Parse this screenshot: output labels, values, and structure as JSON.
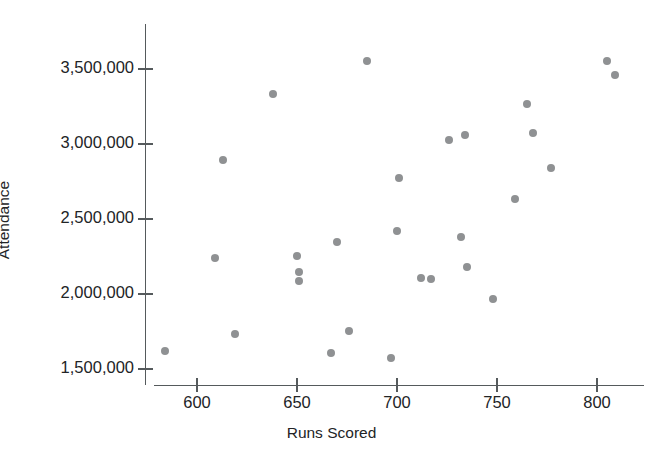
{
  "chart_data": {
    "type": "scatter",
    "title": "",
    "xlabel": "Runs Scored",
    "ylabel": "Attendance",
    "xlim": [
      575,
      820
    ],
    "ylim": [
      1425000,
      3650000
    ],
    "grid": false,
    "legend": null,
    "marker_color": "#87898b",
    "axis_color": "#555a5c",
    "x_ticks": [
      600,
      650,
      700,
      750,
      800
    ],
    "x_tick_labels": [
      "600",
      "650",
      "700",
      "750",
      "800"
    ],
    "y_ticks": [
      1500000,
      2000000,
      2500000,
      3000000,
      3500000
    ],
    "y_tick_labels": [
      "1,500,000",
      "2,000,000",
      "2,500,000",
      "3,000,000",
      "3,500,000"
    ],
    "points": [
      {
        "x": 584,
        "y": 1620000
      },
      {
        "x": 609,
        "y": 2240000
      },
      {
        "x": 613,
        "y": 2893000
      },
      {
        "x": 619,
        "y": 1733000
      },
      {
        "x": 638,
        "y": 3333000
      },
      {
        "x": 650,
        "y": 2253000
      },
      {
        "x": 651,
        "y": 2147000
      },
      {
        "x": 651,
        "y": 2087000
      },
      {
        "x": 667,
        "y": 1607000
      },
      {
        "x": 670,
        "y": 2347000
      },
      {
        "x": 676,
        "y": 1753000
      },
      {
        "x": 685,
        "y": 3553000
      },
      {
        "x": 697,
        "y": 1573000
      },
      {
        "x": 700,
        "y": 2420000
      },
      {
        "x": 701,
        "y": 2773000
      },
      {
        "x": 712,
        "y": 2107000
      },
      {
        "x": 717,
        "y": 2100000
      },
      {
        "x": 726,
        "y": 3027000
      },
      {
        "x": 732,
        "y": 2380000
      },
      {
        "x": 734,
        "y": 3060000
      },
      {
        "x": 735,
        "y": 2180000
      },
      {
        "x": 748,
        "y": 1967000
      },
      {
        "x": 759,
        "y": 2633000
      },
      {
        "x": 765,
        "y": 3267000
      },
      {
        "x": 768,
        "y": 3073000
      },
      {
        "x": 777,
        "y": 2840000
      },
      {
        "x": 805,
        "y": 3553000
      },
      {
        "x": 809,
        "y": 3460000
      }
    ]
  }
}
